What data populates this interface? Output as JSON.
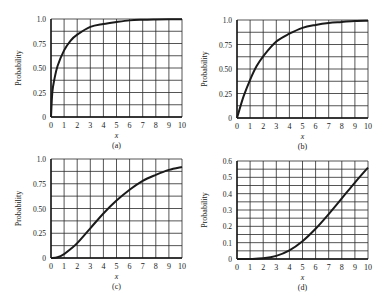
{
  "figure": {
    "panels": [
      {
        "id": "a",
        "caption": "(a)",
        "xlabel": "x",
        "ylabel": "Probability",
        "box": {
          "left": 51,
          "top": 19,
          "right": 182,
          "bottom": 117
        },
        "yticks": [
          "0",
          "0.25",
          "0.50",
          "0.75",
          "1.0"
        ],
        "ymax": 1.0,
        "hgrid": 8
      },
      {
        "id": "b",
        "caption": "(b)",
        "xlabel": "x",
        "ylabel": "Probability",
        "box": {
          "left": 237,
          "top": 20,
          "right": 368,
          "bottom": 118
        },
        "yticks": [
          "0",
          "0.25",
          "0.50",
          "0.75",
          "1.0"
        ],
        "ymax": 1.0,
        "hgrid": 8
      },
      {
        "id": "c",
        "caption": "(c)",
        "xlabel": "x",
        "ylabel": "Probability",
        "box": {
          "left": 51,
          "top": 159,
          "right": 182,
          "bottom": 258
        },
        "yticks": [
          "0",
          "0.25",
          "0.50",
          "0.75",
          "1.0"
        ],
        "ymax": 1.0,
        "hgrid": 8
      },
      {
        "id": "d",
        "caption": "(d)",
        "xlabel": "x",
        "ylabel": "Probability",
        "box": {
          "left": 237,
          "top": 161,
          "right": 368,
          "bottom": 259
        },
        "yticks": [
          "0",
          "0.1",
          "0.2",
          "0.3",
          "0.4",
          "0.5",
          "0.6"
        ],
        "ymax": 0.6,
        "hgrid": 12
      }
    ],
    "xticks": [
      "0",
      "1",
      "2",
      "3",
      "4",
      "5",
      "6",
      "7",
      "8",
      "9",
      "10"
    ],
    "line_color": "#1a1a1a",
    "grid_color": "#2a2a2a"
  },
  "chart_data": [
    {
      "type": "line",
      "title": "(a)",
      "xlabel": "x",
      "ylabel": "Probability",
      "xlim": [
        0,
        10
      ],
      "ylim": [
        0,
        1.0
      ],
      "grid": true,
      "x": [
        0,
        0.1,
        0.25,
        0.5,
        1,
        1.5,
        2,
        3,
        4,
        5,
        6,
        7,
        8,
        9,
        10
      ],
      "values": [
        0,
        0.25,
        0.38,
        0.52,
        0.68,
        0.78,
        0.84,
        0.92,
        0.95,
        0.97,
        0.986,
        0.992,
        0.995,
        0.997,
        0.998
      ]
    },
    {
      "type": "line",
      "title": "(b)",
      "xlabel": "x",
      "ylabel": "Probability",
      "xlim": [
        0,
        10
      ],
      "ylim": [
        0,
        1.0
      ],
      "grid": true,
      "x": [
        0,
        0.5,
        1,
        1.5,
        2,
        3,
        4,
        5,
        6,
        7,
        8,
        9,
        10
      ],
      "values": [
        0,
        0.22,
        0.39,
        0.53,
        0.63,
        0.78,
        0.86,
        0.92,
        0.95,
        0.97,
        0.98,
        0.99,
        0.993
      ]
    },
    {
      "type": "line",
      "title": "(c)",
      "xlabel": "x",
      "ylabel": "Probability",
      "xlim": [
        0,
        10
      ],
      "ylim": [
        0,
        1.0
      ],
      "grid": true,
      "x": [
        0,
        0.5,
        1,
        1.5,
        2,
        3,
        4,
        5,
        6,
        7,
        8,
        9,
        10
      ],
      "values": [
        0,
        0.008,
        0.04,
        0.09,
        0.15,
        0.3,
        0.45,
        0.58,
        0.69,
        0.78,
        0.84,
        0.89,
        0.92
      ]
    },
    {
      "type": "line",
      "title": "(d)",
      "xlabel": "x",
      "ylabel": "Probability",
      "xlim": [
        0,
        10
      ],
      "ylim": [
        0,
        0.6
      ],
      "grid": true,
      "x": [
        0,
        1,
        2,
        3,
        4,
        5,
        6,
        7,
        8,
        9,
        10
      ],
      "values": [
        0,
        0.0002,
        0.004,
        0.019,
        0.053,
        0.109,
        0.185,
        0.275,
        0.371,
        0.468,
        0.56
      ]
    }
  ]
}
